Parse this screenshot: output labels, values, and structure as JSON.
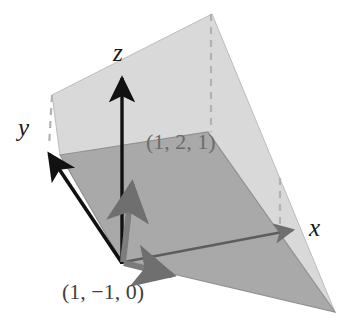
{
  "figure": {
    "kind": "3d-plane-vector-diagram",
    "width": 352,
    "height": 328,
    "background": "#ffffff"
  },
  "axes": [
    {
      "name": "z",
      "label": "z",
      "from": [
        122,
        262
      ],
      "to": [
        122,
        73
      ],
      "color": "#111111"
    },
    {
      "name": "y",
      "label": "y",
      "from": [
        122,
        262
      ],
      "to": [
        45,
        150
      ],
      "color": "#111111"
    },
    {
      "name": "x",
      "label": "x",
      "from": [
        122,
        262
      ],
      "to": [
        298,
        230
      ],
      "color": "#555555"
    }
  ],
  "labels": {
    "z_axis": "z",
    "y_axis": "y",
    "x_axis": "x",
    "point_upper": "(1, 2, 1)",
    "point_lower": "(1, −1, 0)"
  },
  "vectors": [
    {
      "name": "vector-1-2-1",
      "label": "(1, 2, 1)",
      "components": [
        1,
        2,
        1
      ],
      "from": [
        122,
        262
      ],
      "to": [
        133,
        178
      ],
      "color": "#7d7d7d"
    },
    {
      "name": "vector-1-minus1-0",
      "label": "(1, −1, 0)",
      "components": [
        1,
        -1,
        0
      ],
      "from": [
        122,
        262
      ],
      "to": [
        178,
        276
      ],
      "color": "#7b7b7b"
    }
  ],
  "planes": [
    {
      "name": "plane-upper-light",
      "points": "52,95 212,14 335,312 60,155",
      "fill": "#d8d8d8",
      "stroke": "#b4b4b4"
    },
    {
      "name": "plane-lower-dark",
      "points": "60,155 208,132 335,312 122,262",
      "fill": "#a8a8a8",
      "stroke": "#8e8e8e"
    }
  ],
  "dashed_guides": [
    {
      "name": "dash-top-right",
      "from": [
        211,
        14
      ],
      "to": [
        211,
        132
      ]
    },
    {
      "name": "dash-mid-right",
      "from": [
        280,
        178
      ],
      "to": [
        280,
        224
      ]
    },
    {
      "name": "dash-left-y",
      "from": [
        52,
        95
      ],
      "to": [
        49,
        147
      ]
    }
  ],
  "colors": {
    "plane_light": "#d8d8d8",
    "plane_dark": "#a8a8a8",
    "axis_dark": "#111111",
    "vector_gray": "#7d7d7d",
    "label_gray": "#6b6b6b",
    "dash_gray": "#b0b0b0",
    "background": "#ffffff"
  }
}
